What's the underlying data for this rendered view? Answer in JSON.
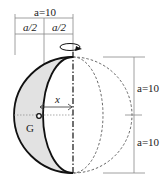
{
  "diagram": {
    "type": "hemisphere-shell rotation about vertical axis",
    "labels": {
      "top_width": "a=10",
      "half_left": "a/2",
      "half_right": "a/2",
      "radius_upper": "a=10",
      "radius_lower": "a=10",
      "distance": "x",
      "centroid": "G"
    },
    "colors": {
      "shaded_region": "#e2e2e2",
      "outline": "#111111",
      "dimension_lines": "#888888",
      "dashed_sphere": "#555555"
    }
  }
}
